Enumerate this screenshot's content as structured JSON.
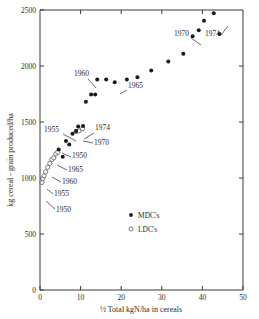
{
  "chart_data": {
    "type": "scatter",
    "title": "",
    "xlabel": "½ Total kgN/ha in cereals",
    "ylabel": "kg cereal - grain produced/ha",
    "xlim": [
      0,
      50
    ],
    "ylim": [
      0,
      2500
    ],
    "xticks": [
      "0",
      "10",
      "20",
      "30",
      "40",
      "50"
    ],
    "xtick_values": [
      0,
      10,
      20,
      30,
      40,
      50
    ],
    "yticks": [
      "0",
      "500",
      "1000",
      "1500",
      "2000",
      "2500"
    ],
    "ytick_values": [
      0,
      500,
      1000,
      1500,
      2000,
      2500
    ],
    "grid": false,
    "legend_position": "center-right-lower",
    "series": [
      {
        "name": "MDC's",
        "marker": "filled-circle",
        "color": "#1a1a1a",
        "points": [
          {
            "x": 4.6,
            "y": 1255
          },
          {
            "x": 5.6,
            "y": 1190
          },
          {
            "x": 6.4,
            "y": 1330
          },
          {
            "x": 7.2,
            "y": 1300
          },
          {
            "x": 8.0,
            "y": 1395
          },
          {
            "x": 8.9,
            "y": 1420
          },
          {
            "x": 9.4,
            "y": 1460
          },
          {
            "x": 10.6,
            "y": 1465
          },
          {
            "x": 11.3,
            "y": 1680
          },
          {
            "x": 12.6,
            "y": 1745
          },
          {
            "x": 13.6,
            "y": 1745
          },
          {
            "x": 14.1,
            "y": 1880
          },
          {
            "x": 16.3,
            "y": 1880
          },
          {
            "x": 18.4,
            "y": 1855
          },
          {
            "x": 21.4,
            "y": 1880
          },
          {
            "x": 24.0,
            "y": 1900
          },
          {
            "x": 27.4,
            "y": 1960
          },
          {
            "x": 31.6,
            "y": 2040
          },
          {
            "x": 35.3,
            "y": 2110
          },
          {
            "x": 37.6,
            "y": 2265
          },
          {
            "x": 39.1,
            "y": 2320
          },
          {
            "x": 40.4,
            "y": 2405
          },
          {
            "x": 42.8,
            "y": 2470
          },
          {
            "x": 44.2,
            "y": 2285
          }
        ]
      },
      {
        "name": "LDC's",
        "marker": "open-circle",
        "color": "#5a5a5a",
        "points": [
          {
            "x": 0.5,
            "y": 960
          },
          {
            "x": 0.7,
            "y": 995
          },
          {
            "x": 1.0,
            "y": 1020
          },
          {
            "x": 1.4,
            "y": 1055
          },
          {
            "x": 1.9,
            "y": 1095
          },
          {
            "x": 2.4,
            "y": 1130
          },
          {
            "x": 2.9,
            "y": 1165
          },
          {
            "x": 3.4,
            "y": 1180
          },
          {
            "x": 3.9,
            "y": 1215
          },
          {
            "x": 4.4,
            "y": 1230
          },
          {
            "x": 8.9,
            "y": 1415
          },
          {
            "x": 9.6,
            "y": 1420
          },
          {
            "x": 10.5,
            "y": 1440
          }
        ]
      }
    ],
    "annotations": [
      {
        "text": "1955",
        "label_x": 44,
        "label_y": 132,
        "line": [
          63,
          134,
          76,
          141
        ]
      },
      {
        "text": "1960",
        "label_x": 74,
        "label_y": 76,
        "line": [
          88,
          79,
          96,
          88
        ]
      },
      {
        "text": "1965",
        "label_x": 128,
        "label_y": 88,
        "line": [
          127,
          90,
          120,
          94
        ]
      },
      {
        "text": "1970",
        "label_x": 174,
        "label_y": 36,
        "line": [
          191,
          38,
          201,
          45
        ]
      },
      {
        "text": "1974",
        "label_x": 205,
        "label_y": 36,
        "line": [
          221,
          35,
          228,
          26
        ]
      },
      {
        "text": "1974",
        "label_x": 95,
        "label_y": 130,
        "line": [
          94,
          133,
          84,
          139
        ]
      },
      {
        "text": "1970",
        "label_x": 94,
        "label_y": 145,
        "line": [
          93,
          143,
          83,
          141
        ]
      },
      {
        "text": "1950",
        "label_x": 72,
        "label_y": 158,
        "line": [
          71,
          157,
          62,
          153
        ]
      },
      {
        "text": "1965",
        "label_x": 68,
        "label_y": 172,
        "line": [
          67,
          170,
          57,
          165
        ]
      },
      {
        "text": "1960",
        "label_x": 62,
        "label_y": 184,
        "line": [
          61,
          182,
          52,
          177
        ]
      },
      {
        "text": "1955",
        "label_x": 54,
        "label_y": 196,
        "line": [
          53,
          194,
          47,
          189
        ]
      },
      {
        "text": "1950",
        "label_x": 56,
        "label_y": 212,
        "line": [
          55,
          209,
          46,
          201
        ]
      }
    ],
    "legend_entries": [
      {
        "label": "MDC's",
        "marker": "filled-circle"
      },
      {
        "label": "LDC's",
        "marker": "open-circle"
      }
    ]
  }
}
